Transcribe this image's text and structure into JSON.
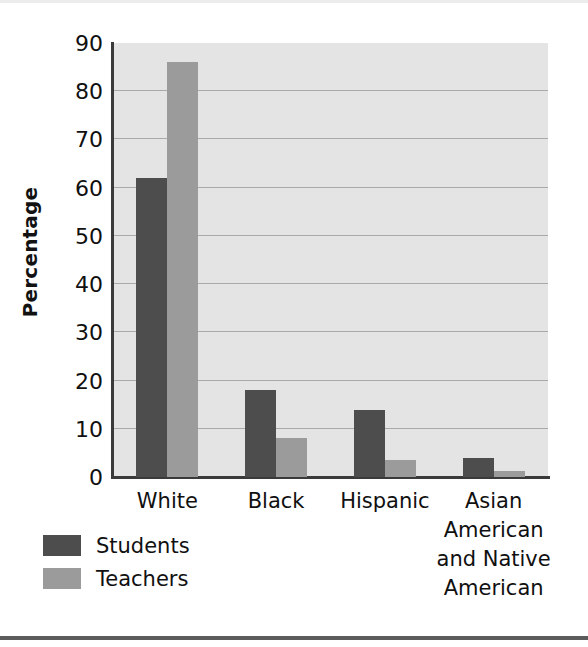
{
  "chart_data": {
    "type": "bar",
    "title": "",
    "subtitle": "",
    "xlabel": "",
    "ylabel": "Percentage",
    "ylim": [
      0,
      90
    ],
    "yticks": [
      0,
      10,
      20,
      30,
      40,
      50,
      60,
      70,
      80,
      90
    ],
    "ytick_labels": [
      "0",
      "10",
      "20",
      "30",
      "40",
      "50",
      "60",
      "70",
      "80",
      "90"
    ],
    "grid": "horizontal",
    "legend_position": "below-left",
    "categories": [
      "White",
      "Black",
      "Hispanic",
      "Asian American and Native American"
    ],
    "category_labels": [
      [
        "White"
      ],
      [
        "Black"
      ],
      [
        "Hispanic"
      ],
      [
        "Asian",
        "American",
        "and Native",
        "American"
      ]
    ],
    "series": [
      {
        "name": "Students",
        "color": "#4d4d4d",
        "values": [
          62,
          18,
          14,
          4
        ]
      },
      {
        "name": "Teachers",
        "color": "#9b9b9b",
        "values": [
          86,
          8,
          3.5,
          1.2
        ]
      }
    ],
    "plot_background": "#e4e4e4",
    "gridline_color": "#a9a9a9",
    "axis_color": "#3a3a3a"
  },
  "legend": {
    "items": [
      {
        "label": "Students",
        "swatch": "students-swatch"
      },
      {
        "label": "Teachers",
        "swatch": "teachers-swatch"
      }
    ]
  },
  "axes": {
    "y_title": "Percentage"
  }
}
